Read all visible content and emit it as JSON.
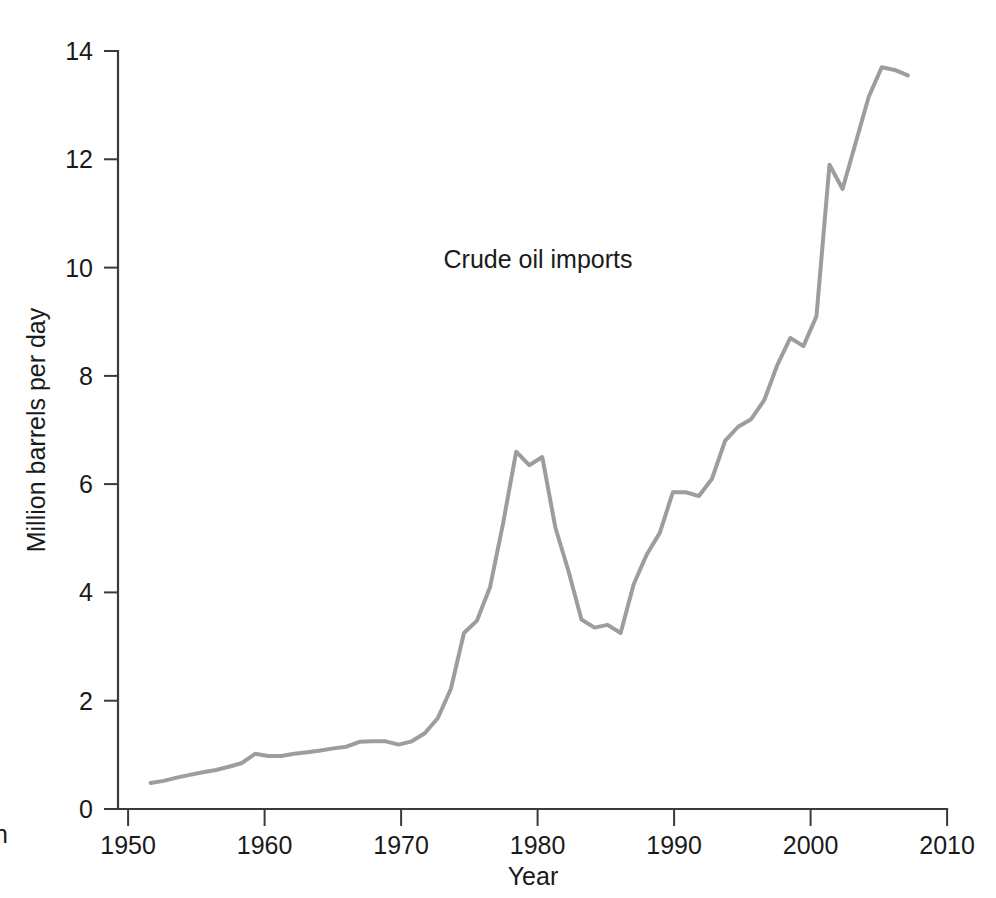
{
  "chart_data": {
    "type": "line",
    "title": "",
    "annotation": "Crude oil imports",
    "xlabel": "Year",
    "ylabel": "Million barrels per day",
    "xlim": [
      1946.5,
      2010
    ],
    "ylim": [
      0,
      14
    ],
    "xticks": [
      1950,
      1960,
      1970,
      1980,
      1990,
      2000,
      2010
    ],
    "xtick_labels": [
      "1950",
      "1960",
      "1970",
      "1980",
      "1990",
      "2000",
      "2010"
    ],
    "yticks": [
      0,
      2,
      4,
      6,
      8,
      10,
      12,
      14
    ],
    "ytick_labels": [
      "0",
      "2",
      "4",
      "6",
      "8",
      "10",
      "12",
      "14"
    ],
    "grid": false,
    "legend": null,
    "line_color": "#9d9d9d",
    "axis_color": "#3a3a3a",
    "series": [
      {
        "name": "Crude oil imports",
        "x": [
          1949,
          1950,
          1951,
          1952,
          1953,
          1954,
          1955,
          1956,
          1957,
          1958,
          1959,
          1960,
          1961,
          1962,
          1963,
          1964,
          1965,
          1966,
          1967,
          1968,
          1969,
          1970,
          1971,
          1972,
          1973,
          1974,
          1975,
          1976,
          1977,
          1978,
          1979,
          1980,
          1981,
          1982,
          1983,
          1984,
          1985,
          1986,
          1987,
          1988,
          1989,
          1990,
          1991,
          1992,
          1993,
          1994,
          1995,
          1996,
          1997,
          1998,
          1999,
          2000,
          2001,
          2002,
          2003,
          2004,
          2005,
          2006,
          2007
        ],
        "values": [
          0.48,
          0.52,
          0.58,
          0.63,
          0.68,
          0.72,
          0.78,
          0.85,
          1.02,
          0.98,
          0.98,
          1.02,
          1.05,
          1.08,
          1.12,
          1.15,
          1.24,
          1.25,
          1.25,
          1.19,
          1.25,
          1.4,
          1.68,
          2.22,
          3.25,
          3.48,
          4.1,
          5.28,
          6.6,
          6.35,
          6.5,
          5.2,
          4.4,
          3.5,
          3.35,
          3.4,
          3.25,
          4.15,
          4.7,
          5.1,
          5.85,
          5.85,
          5.78,
          6.1,
          6.8,
          7.06,
          7.2,
          7.55,
          8.2,
          8.7,
          8.55,
          9.1,
          11.9,
          11.45,
          12.3,
          13.15,
          13.7,
          13.65,
          13.55
        ]
      }
    ]
  },
  "edge_text_fragment": "n"
}
